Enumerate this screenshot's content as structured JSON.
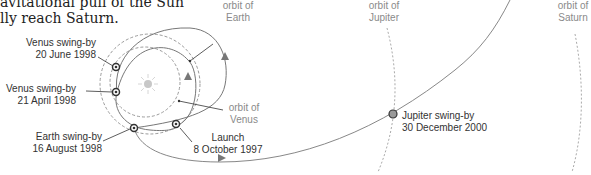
{
  "intro_text": {
    "line1": "avitational pull of the Sun",
    "line2": "lly reach Saturn."
  },
  "labels": {
    "venus_swingby_1": {
      "title": "Venus swing-by",
      "date": "20 June 1998"
    },
    "venus_swingby_2": {
      "title": "Venus swing-by",
      "date": "21 April 1998"
    },
    "earth_swingby": {
      "title": "Earth swing-by",
      "date": "16 August 1998"
    },
    "launch": {
      "title": "Launch",
      "date": "8 October 1997"
    },
    "jupiter_swingby": {
      "title": "Jupiter swing-by",
      "date": "30 December 2000"
    },
    "orbit_earth": {
      "line1": "orbit of",
      "line2": "Earth"
    },
    "orbit_venus": {
      "line1": "orbit of",
      "line2": "Venus"
    },
    "orbit_jupiter": {
      "line1": "orbit of",
      "line2": "Jupiter"
    },
    "orbit_saturn": {
      "line1": "orbit of",
      "line2": "Saturn"
    }
  },
  "colors": {
    "trajectory": "#777777",
    "orbit_dashed": "#9a9a9a",
    "sun": "#c8c8c8",
    "event_marker": "#333333",
    "jupiter_marker": "#999999"
  }
}
